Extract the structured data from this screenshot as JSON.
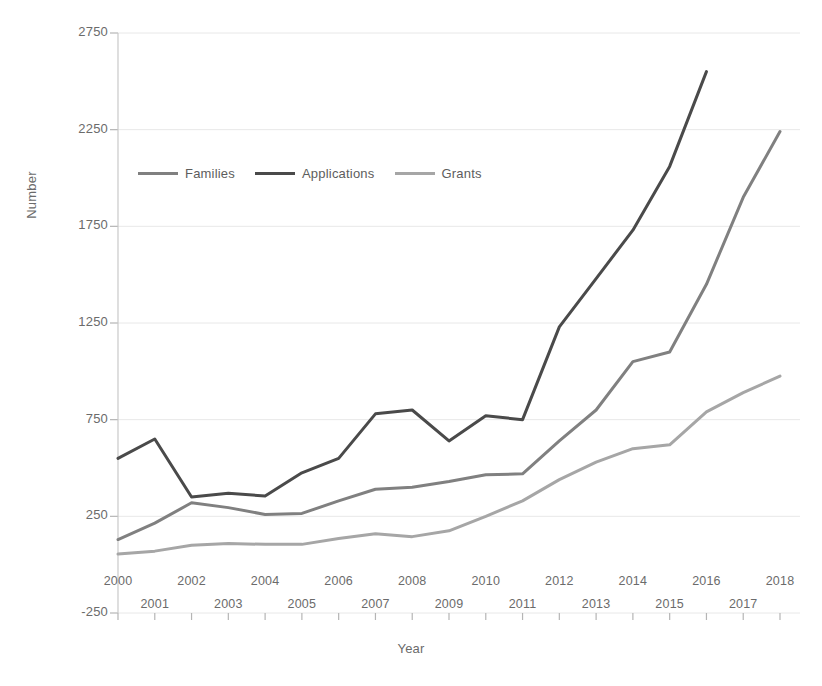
{
  "chart_data": {
    "type": "line",
    "title": "",
    "xlabel": "Year",
    "ylabel": "Number",
    "x": [
      2000,
      2001,
      2002,
      2003,
      2004,
      2005,
      2006,
      2007,
      2008,
      2009,
      2010,
      2011,
      2012,
      2013,
      2014,
      2015,
      2016,
      2017,
      2018
    ],
    "xlim": [
      2000,
      2018
    ],
    "ylim": [
      -250,
      2750
    ],
    "yticks": [
      -250,
      250,
      750,
      1250,
      1750,
      2250,
      2750
    ],
    "ytick_labels": [
      "-250",
      "250",
      "750",
      "1250",
      "1750",
      "2250",
      "2750"
    ],
    "xtick_labels": [
      "2000",
      "2001",
      "2002",
      "2003",
      "2004",
      "2005",
      "2006",
      "2007",
      "2008",
      "2009",
      "2010",
      "2011",
      "2012",
      "2013",
      "2014",
      "2015",
      "2016",
      "2017",
      "2018"
    ],
    "grid": "horizontal",
    "legend_position": "upper-left-inside",
    "series": [
      {
        "name": "Families",
        "color": "#808080",
        "width": 3,
        "values": [
          130,
          215,
          320,
          295,
          260,
          265,
          330,
          390,
          400,
          430,
          465,
          470,
          640,
          800,
          1050,
          1100,
          1450,
          1900,
          2240
        ]
      },
      {
        "name": "Applications",
        "color": "#4a4a4a",
        "width": 3,
        "values": [
          550,
          650,
          350,
          370,
          355,
          475,
          550,
          780,
          800,
          640,
          770,
          750,
          1230,
          1480,
          1730,
          2060,
          2550,
          null,
          null
        ]
      },
      {
        "name": "Grants",
        "color": "#a6a6a6",
        "width": 3,
        "values": [
          55,
          70,
          100,
          110,
          105,
          105,
          135,
          160,
          145,
          175,
          250,
          330,
          440,
          530,
          600,
          620,
          790,
          890,
          975
        ]
      }
    ]
  },
  "axis": {
    "y_title": "Number",
    "x_title": "Year",
    "axis_color": "#bfbfbf",
    "grid_color": "#e8e8e8",
    "tick_text_color": "#6b6b6b"
  },
  "legend": {
    "items": [
      {
        "label": "Families",
        "color": "#808080"
      },
      {
        "label": "Applications",
        "color": "#4a4a4a"
      },
      {
        "label": "Grants",
        "color": "#a6a6a6"
      }
    ]
  }
}
